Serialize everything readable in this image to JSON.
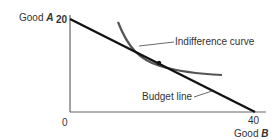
{
  "diagram": {
    "y_axis": {
      "label_prefix": "Good ",
      "label_var": "A",
      "tick": "20"
    },
    "x_axis": {
      "label_prefix": "Good ",
      "label_var": "B",
      "tick": "40"
    },
    "origin": "0",
    "curves": [
      {
        "name": "Indifference curve",
        "label": "Indifference curve"
      },
      {
        "name": "Budget line",
        "label": "Budget line"
      }
    ],
    "colors": {
      "axis": "#555555",
      "budget_line": "#111111",
      "indifference_curve": "#555555",
      "text": "#333333"
    }
  }
}
